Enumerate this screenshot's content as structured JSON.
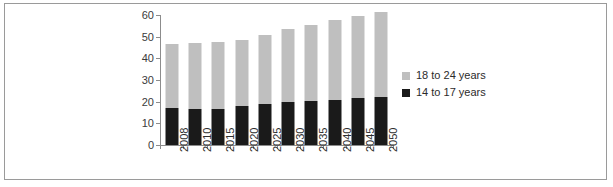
{
  "chart_data": {
    "type": "bar",
    "subtype": "stacked-vertical-bar",
    "title": "",
    "subtitle": "",
    "xlabel": "",
    "ylabel": "",
    "categories": [
      "2008",
      "2010",
      "2015",
      "2020",
      "2025",
      "2030",
      "2035",
      "2040",
      "2045",
      "2050"
    ],
    "series": [
      {
        "name": "14 to 17 years",
        "color": "#1a1a1a",
        "stack_order": "bottom",
        "values": [
          17.2,
          16.8,
          16.7,
          17.9,
          18.7,
          19.7,
          20.2,
          21.0,
          21.6,
          22.3
        ]
      },
      {
        "name": "18 to 24 years",
        "color": "#bfbfbf",
        "stack_order": "top",
        "values": [
          29.6,
          30.4,
          30.7,
          30.6,
          32.2,
          33.7,
          35.3,
          36.6,
          38.0,
          39.1
        ]
      }
    ],
    "totals": [
      46.8,
      47.2,
      47.4,
      48.5,
      50.9,
      53.4,
      55.5,
      57.6,
      59.6,
      61.4
    ],
    "ylim": [
      0,
      60
    ],
    "ytick_values": [
      0,
      10,
      20,
      30,
      40,
      50,
      60
    ],
    "ytick_labels": [
      "0",
      "10",
      "20",
      "30",
      "40",
      "50",
      "60"
    ],
    "grid": false,
    "legend_position": "right",
    "legend_entries": [
      "18 to 24 years",
      "14 to 17 years"
    ],
    "axis_color": "#8c8c8c",
    "background_color": "#ffffff",
    "frame_color": "#9a9a9a",
    "category_label_rotation": -90
  }
}
